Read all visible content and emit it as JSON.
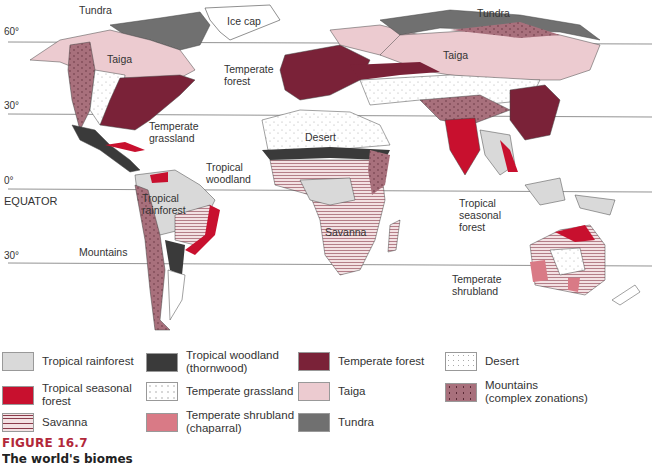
{
  "colors": {
    "tropical_rainforest": "#d9d9d9",
    "tropical_seasonal_forest": "#c8102e",
    "savanna": "#f3e1e3",
    "savanna_lines": "#8a3a4a",
    "tropical_woodland": "#3a3a3a",
    "temperate_grassland": "#ffffff",
    "temperate_shrubland": "#d97a86",
    "temperate_forest": "#7a2238",
    "taiga": "#eccbd0",
    "tundra": "#707070",
    "desert": "#ffffff",
    "mountains": "#a8707c",
    "ocean": "#ffffff",
    "latitude_line": "#777777",
    "figure_title": "#b2283a"
  },
  "latitudes": [
    {
      "label": "60°",
      "y": 42
    },
    {
      "label": "30°",
      "y": 114
    },
    {
      "label": "0°",
      "y": 189
    },
    {
      "label": "30°",
      "y": 263
    }
  ],
  "equator_label": "EQUATOR",
  "map_labels": {
    "tundra_na": "Tundra",
    "ice_cap": "Ice cap",
    "taiga_na": "Taiga",
    "temperate_forest": "Temperate\nforest",
    "temperate_grassland": "Temperate\ngrassland",
    "tropical_woodland": "Tropical\nwoodland",
    "tropical_rainforest": "Tropical\nrainforest",
    "mountains": "Mountains",
    "desert": "Desert",
    "savanna": "Savanna",
    "tundra_asia": "Tundra",
    "taiga_asia": "Taiga",
    "tropical_seasonal_forest": "Tropical\nseasonal\nforest",
    "temperate_shrubland": "Temperate\nshrubland"
  },
  "legend": [
    {
      "key": "tropical_rainforest",
      "label": "Tropical rainforest"
    },
    {
      "key": "tropical_seasonal_forest",
      "label": "Tropical seasonal\nforest"
    },
    {
      "key": "savanna",
      "label": "Savanna"
    },
    {
      "key": "tropical_woodland",
      "label": "Tropical woodland\n(thornwood)"
    },
    {
      "key": "temperate_grassland",
      "label": "Temperate grassland"
    },
    {
      "key": "temperate_shrubland",
      "label": "Temperate shrubland\n(chaparral)"
    },
    {
      "key": "temperate_forest",
      "label": "Temperate forest"
    },
    {
      "key": "taiga",
      "label": "Taiga"
    },
    {
      "key": "tundra",
      "label": "Tundra"
    },
    {
      "key": "desert",
      "label": "Desert"
    },
    {
      "key": "mountains",
      "label": "Mountains\n(complex zonations)"
    }
  ],
  "figure": {
    "title": "FIGURE 16.7",
    "caption": "The world's biomes"
  }
}
